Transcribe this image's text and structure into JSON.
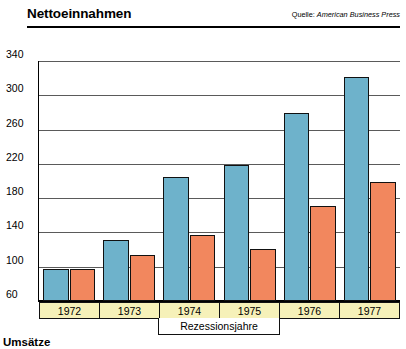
{
  "header": {
    "title": "Nettoeinnahmen",
    "source_label": "Quelle:",
    "source_name": "American Business Press"
  },
  "footer": {
    "title": "Umsätze"
  },
  "annotation": {
    "recession_label": "Rezessionsjahre"
  },
  "colors": {
    "series1": "#6eb2cb",
    "series2": "#f2875e",
    "year_band": "#f6f1b9",
    "gridline": "#5a5a5a",
    "outline": "#111111"
  },
  "chart_data": {
    "type": "bar",
    "title": "Nettoeinnahmen",
    "subtitle": "Quelle: American Business Press",
    "xlabel": "",
    "ylabel": "",
    "categories": [
      "1972",
      "1973",
      "1974",
      "1975",
      "1976",
      "1977"
    ],
    "series": [
      {
        "name": "series-blue",
        "color": "#6eb2cb",
        "values": [
          96,
          130,
          203,
          218,
          278,
          320
        ]
      },
      {
        "name": "series-orange",
        "color": "#f2875e",
        "values": [
          96,
          113,
          136,
          120,
          170,
          198
        ]
      }
    ],
    "ylim": [
      60,
      340
    ],
    "yticks": [
      340,
      300,
      260,
      220,
      180,
      140,
      100,
      60
    ],
    "ytick_labels": [
      "340",
      "300",
      "260",
      "220",
      "180",
      "140",
      "100",
      "60"
    ],
    "grid": true,
    "legend": "none",
    "annotations": [
      {
        "text": "Rezessionsjahre",
        "spans_categories": [
          "1974",
          "1975"
        ]
      }
    ]
  }
}
